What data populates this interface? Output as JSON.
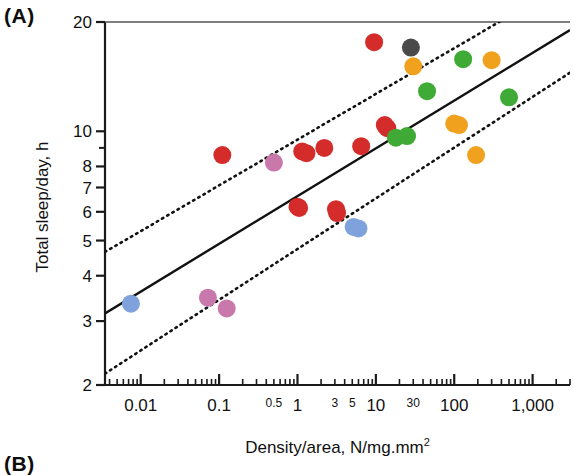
{
  "figure": {
    "panel_a_label": "(A)",
    "panel_b_label": "(B)"
  },
  "axes": {
    "y_title": "Total sleep/day, h",
    "x_title_main": "Density/area, N/mg.mm",
    "x_title_superscript": "2"
  },
  "chart_data": {
    "type": "scatter",
    "title": "",
    "xlabel": "Density/area, N/mg.mm2",
    "ylabel": "Total sleep/day, h",
    "xscale": "log",
    "yscale": "log",
    "xlim": [
      0.0035,
      3000
    ],
    "ylim": [
      2,
      20
    ],
    "grid": false,
    "legend": "none",
    "x_ticks_major": [
      0.01,
      0.1,
      1,
      100,
      1000
    ],
    "x_tick_labels_major": [
      "0.01",
      "0.1",
      "1",
      "100",
      "1,000"
    ],
    "x_ticks_minor_labeled": [
      0.5,
      3,
      5,
      10,
      30
    ],
    "x_tick_labels_minor": [
      "0.5",
      "3",
      "5",
      "10",
      "30"
    ],
    "y_ticks": [
      2,
      3,
      4,
      5,
      6,
      7,
      8,
      10,
      20
    ],
    "y_tick_labels": [
      "2",
      "3",
      "4",
      "5",
      "6",
      "7",
      "8",
      "10",
      "20"
    ],
    "marker_radius_px": 9,
    "colors": {
      "red": "#d42b2b",
      "green": "#3faa35",
      "orange": "#f0a21e",
      "blue": "#7fa2dd",
      "pink": "#c878aa",
      "dark_gray": "#4a4a4a"
    },
    "points": [
      {
        "x": 0.0075,
        "y": 3.35,
        "color": "blue"
      },
      {
        "x": 0.072,
        "y": 3.48,
        "color": "pink"
      },
      {
        "x": 0.125,
        "y": 3.25,
        "color": "pink"
      },
      {
        "x": 0.11,
        "y": 8.6,
        "color": "red"
      },
      {
        "x": 0.5,
        "y": 8.2,
        "color": "pink"
      },
      {
        "x": 1.0,
        "y": 6.2,
        "color": "red"
      },
      {
        "x": 1.05,
        "y": 6.15,
        "color": "red"
      },
      {
        "x": 1.15,
        "y": 8.8,
        "color": "red"
      },
      {
        "x": 1.3,
        "y": 8.7,
        "color": "red"
      },
      {
        "x": 2.2,
        "y": 9.0,
        "color": "red"
      },
      {
        "x": 3.1,
        "y": 6.1,
        "color": "red"
      },
      {
        "x": 3.2,
        "y": 5.95,
        "color": "red"
      },
      {
        "x": 5.2,
        "y": 5.45,
        "color": "blue"
      },
      {
        "x": 6.0,
        "y": 5.4,
        "color": "blue"
      },
      {
        "x": 6.5,
        "y": 9.1,
        "color": "red"
      },
      {
        "x": 9.5,
        "y": 17.6,
        "color": "red"
      },
      {
        "x": 13.0,
        "y": 10.4,
        "color": "red"
      },
      {
        "x": 14.0,
        "y": 10.2,
        "color": "red"
      },
      {
        "x": 18.0,
        "y": 9.6,
        "color": "green"
      },
      {
        "x": 25.0,
        "y": 9.7,
        "color": "green"
      },
      {
        "x": 28.0,
        "y": 17.0,
        "color": "dark_gray"
      },
      {
        "x": 30.0,
        "y": 15.1,
        "color": "orange"
      },
      {
        "x": 45.0,
        "y": 12.9,
        "color": "green"
      },
      {
        "x": 100.0,
        "y": 10.5,
        "color": "orange"
      },
      {
        "x": 115.0,
        "y": 10.4,
        "color": "orange"
      },
      {
        "x": 130.0,
        "y": 15.8,
        "color": "green"
      },
      {
        "x": 190.0,
        "y": 8.6,
        "color": "orange"
      },
      {
        "x": 300.0,
        "y": 15.7,
        "color": "orange"
      },
      {
        "x": 500.0,
        "y": 12.4,
        "color": "green"
      }
    ],
    "fit_line": {
      "style": "solid",
      "description": "regression line",
      "x_start": 0.0035,
      "y_start": 3.15,
      "x_end": 3000,
      "y_end": 19.0
    },
    "confidence_bands": [
      {
        "style": "dotted",
        "name": "upper-confidence-band",
        "x_start": 0.0035,
        "y_start": 4.65,
        "x_end": 3000,
        "y_end": 26.0
      },
      {
        "style": "dotted",
        "name": "lower-confidence-band",
        "x_start": 0.0035,
        "y_start": 2.15,
        "x_end": 3000,
        "y_end": 14.5
      }
    ]
  }
}
